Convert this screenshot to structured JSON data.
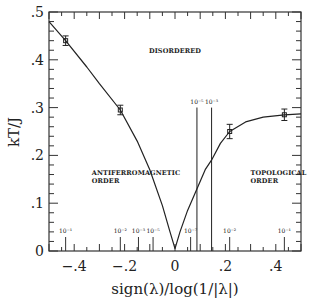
{
  "chart_data": {
    "type": "line",
    "title": "",
    "xlabel": "sign(λ)/log(1/|λ|)",
    "ylabel": "kT/J",
    "xlim": [
      -0.5,
      0.5
    ],
    "ylim": [
      0,
      0.5
    ],
    "xticks": [
      "-.4",
      "-.2",
      "0",
      ".2",
      ".4"
    ],
    "xtick_values": [
      -0.4,
      -0.2,
      0,
      0.2,
      0.4
    ],
    "yticks": [
      "0",
      ".1",
      ".2",
      ".3",
      ".4",
      ".5"
    ],
    "ytick_values": [
      0,
      0.1,
      0.2,
      0.3,
      0.4,
      0.5
    ],
    "grid": false,
    "series": [
      {
        "name": "phase boundary curve",
        "style": "line",
        "x": [
          -0.5,
          -0.434,
          -0.35,
          -0.3,
          -0.217,
          -0.15,
          -0.1,
          -0.05,
          -0.02,
          0,
          0.02,
          0.05,
          0.087,
          0.12,
          0.145,
          0.18,
          0.217,
          0.28,
          0.35,
          0.434,
          0.5
        ],
        "y": [
          0.48,
          0.44,
          0.385,
          0.35,
          0.295,
          0.23,
          0.17,
          0.095,
          0.04,
          0.005,
          0.04,
          0.085,
          0.13,
          0.17,
          0.19,
          0.225,
          0.25,
          0.27,
          0.28,
          0.285,
          0.287
        ]
      },
      {
        "name": "simulation data",
        "style": "points-with-error-bars",
        "x": [
          -0.434,
          -0.217,
          0.217,
          0.434
        ],
        "y": [
          0.44,
          0.295,
          0.25,
          0.285
        ],
        "yerr": [
          0.01,
          0.01,
          0.015,
          0.012
        ]
      }
    ],
    "vertical_lines": [
      {
        "x": 0.087,
        "label": "10⁻⁵",
        "y_top": 0.3
      },
      {
        "x": 0.145,
        "label": "10⁻³",
        "y_top": 0.3
      }
    ],
    "annotations": [
      {
        "text": "DISORDERED",
        "x": 0.0,
        "y": 0.415
      },
      {
        "text": "ANTIFERROMAGNETIC",
        "x": -0.33,
        "y": 0.158
      },
      {
        "text": "ORDER",
        "x": -0.33,
        "y": 0.143
      },
      {
        "text": "TOPOLOGICAL",
        "x": 0.3,
        "y": 0.158
      },
      {
        "text": "ORDER",
        "x": 0.3,
        "y": 0.143
      }
    ],
    "lambda_ticks": [
      {
        "x": -0.434,
        "label": "10⁻¹"
      },
      {
        "x": -0.217,
        "label": "10⁻²"
      },
      {
        "x": -0.145,
        "label": "10⁻³"
      },
      {
        "x": -0.087,
        "label": "10⁻⁵"
      },
      {
        "x": 0.062,
        "label": "10⁻⁷"
      },
      {
        "x": 0.217,
        "label": "10⁻²"
      },
      {
        "x": 0.434,
        "label": "10⁻¹"
      }
    ]
  },
  "labels": {
    "xlabel": "sign(λ)/log(1/|λ|)",
    "ylabel": "kT/J",
    "disordered": "DISORDERED",
    "afm1": "ANTIFERROMAGNETIC",
    "afm2": "ORDER",
    "topo1": "TOPOLOGICAL",
    "topo2": "ORDER",
    "vline1": "10⁻⁵",
    "vline2": "10⁻³"
  }
}
